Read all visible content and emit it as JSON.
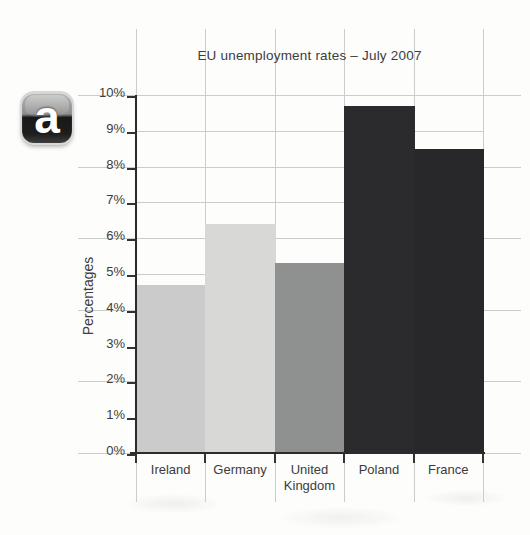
{
  "figure": {
    "badge_label": "a"
  },
  "chart_data": {
    "type": "bar",
    "title": "EU unemployment rates – July 2007",
    "xlabel": "",
    "ylabel": "Percentages",
    "categories": [
      "Ireland",
      "Germany",
      "United Kingdom",
      "Poland",
      "France"
    ],
    "values": [
      4.7,
      6.4,
      5.3,
      9.7,
      8.5
    ],
    "bar_colors": [
      "#cbcbcb",
      "#d8d8d6",
      "#8f9090",
      "#2b2b2d",
      "#28282a"
    ],
    "ylim": [
      0,
      10
    ],
    "ytick_step": 1,
    "ytick_suffix": "%",
    "grid": "on",
    "legend": "none",
    "layout_hints": {
      "even_percent_gridlines": "span full page width",
      "odd_percent_gridlines": "span plot area only",
      "bars": "flush side-by-side, no gaps"
    }
  },
  "colors": {
    "background": "#fdfdfc",
    "grid": "#c9cdcc",
    "axis": "#2b2b2b",
    "text": "#3c3c3c",
    "badge_text": "#ffffff"
  }
}
